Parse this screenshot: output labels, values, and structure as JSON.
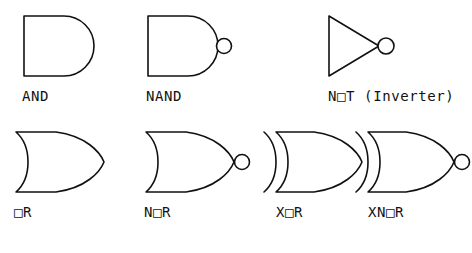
{
  "figure": {
    "background_color": "#ffffff",
    "stroke_color": "#111111",
    "stroke_width": 1.6
  },
  "gates": [
    {
      "id": "and",
      "label": "AND",
      "name": "AND",
      "shape": "and-gate-symbol",
      "row": 1,
      "column": 1,
      "has_output_bubble": false,
      "back_arcs": 0
    },
    {
      "id": "nand",
      "label": "NAND",
      "name": "NAND",
      "shape": "nand-gate-symbol",
      "row": 1,
      "column": 2,
      "has_output_bubble": true,
      "back_arcs": 0
    },
    {
      "id": "not",
      "label": "N□T (Inverter)",
      "name": "NOT (Inverter)",
      "shape": "not-gate-symbol",
      "row": 1,
      "column": 3,
      "has_output_bubble": true,
      "back_arcs": 0
    },
    {
      "id": "or",
      "label": "□R",
      "name": "OR",
      "shape": "or-gate-symbol",
      "row": 2,
      "column": 1,
      "has_output_bubble": false,
      "back_arcs": 1
    },
    {
      "id": "nor",
      "label": "N□R",
      "name": "NOR",
      "shape": "nor-gate-symbol",
      "row": 2,
      "column": 2,
      "has_output_bubble": true,
      "back_arcs": 1
    },
    {
      "id": "xor",
      "label": "X□R",
      "name": "XOR",
      "shape": "xor-gate-symbol",
      "row": 2,
      "column": 3,
      "has_output_bubble": false,
      "back_arcs": 2
    },
    {
      "id": "xnor",
      "label": "XN□R",
      "name": "XNOR",
      "shape": "xnor-gate-symbol",
      "row": 2,
      "column": 4,
      "has_output_bubble": true,
      "back_arcs": 2
    }
  ]
}
